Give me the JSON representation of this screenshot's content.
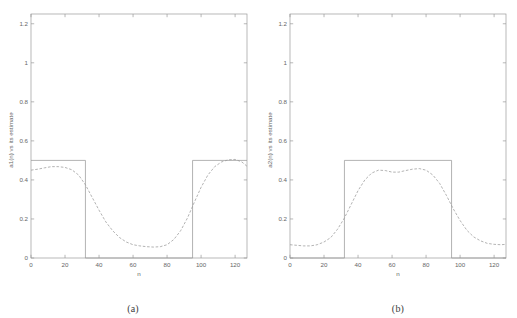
{
  "figure": {
    "background": "#ffffff",
    "line_color": "#9a9a9a",
    "text_color": "#666666",
    "panels": [
      {
        "id": "a",
        "caption": "(a)",
        "ylabel": "a1(n) vs its estimate",
        "xlabel": "n"
      },
      {
        "id": "b",
        "caption": "(b)",
        "ylabel": "a2(n) vs its estimate",
        "xlabel": "n"
      }
    ]
  },
  "chart_data": [
    {
      "type": "line",
      "title": "",
      "panel": "(a)",
      "xlabel": "n",
      "ylabel": "a1(n) vs its estimate",
      "xlim": [
        0,
        127
      ],
      "ylim": [
        0,
        1.25
      ],
      "xticks": [
        0,
        20,
        40,
        60,
        80,
        100,
        120
      ],
      "xticklabels": [
        "0",
        "20",
        "40",
        "60",
        "80",
        "100",
        "120"
      ],
      "yticks": [
        0,
        0.2,
        0.4,
        0.6,
        0.8,
        1,
        1.2
      ],
      "yticklabels": [
        "0",
        "0.2",
        "0.4",
        "0.6",
        "0.8",
        "1",
        "1.2"
      ],
      "grid": false,
      "legend": null,
      "series": [
        {
          "name": "a1(n) true (square wave)",
          "style": "solid",
          "color": "#9a9a9a",
          "x": [
            0,
            32,
            32,
            95,
            95,
            127
          ],
          "y": [
            0.5,
            0.5,
            0.0,
            0.0,
            0.5,
            0.5
          ]
        },
        {
          "name": "a1(n) estimate (dashed)",
          "style": "dashed",
          "color": "#9a9a9a",
          "x": [
            0,
            4,
            8,
            12,
            16,
            20,
            24,
            28,
            32,
            36,
            40,
            44,
            48,
            52,
            56,
            60,
            64,
            68,
            72,
            76,
            80,
            84,
            88,
            92,
            96,
            100,
            104,
            108,
            112,
            116,
            120,
            124,
            127
          ],
          "y": [
            0.45,
            0.455,
            0.462,
            0.468,
            0.468,
            0.464,
            0.452,
            0.425,
            0.375,
            0.31,
            0.245,
            0.185,
            0.14,
            0.105,
            0.082,
            0.068,
            0.062,
            0.058,
            0.056,
            0.058,
            0.068,
            0.095,
            0.14,
            0.205,
            0.285,
            0.362,
            0.425,
            0.468,
            0.492,
            0.503,
            0.505,
            0.492,
            0.47
          ]
        }
      ]
    },
    {
      "type": "line",
      "title": "",
      "panel": "(b)",
      "xlabel": "n",
      "ylabel": "a2(n) vs its estimate",
      "xlim": [
        0,
        127
      ],
      "ylim": [
        0,
        1.25
      ],
      "xticks": [
        0,
        20,
        40,
        60,
        80,
        100,
        120
      ],
      "xticklabels": [
        "0",
        "20",
        "40",
        "60",
        "80",
        "100",
        "120"
      ],
      "yticks": [
        0,
        0.2,
        0.4,
        0.6,
        0.8,
        1,
        1.2
      ],
      "yticklabels": [
        "0",
        "0.2",
        "0.4",
        "0.6",
        "0.8",
        "1",
        "1.2"
      ],
      "grid": false,
      "legend": null,
      "series": [
        {
          "name": "a2(n) true (square wave)",
          "style": "solid",
          "color": "#9a9a9a",
          "x": [
            0,
            32,
            32,
            95,
            95,
            127
          ],
          "y": [
            0.0,
            0.0,
            0.5,
            0.5,
            0.0,
            0.0
          ]
        },
        {
          "name": "a2(n) estimate (dashed)",
          "style": "dashed",
          "color": "#9a9a9a",
          "x": [
            0,
            4,
            8,
            12,
            16,
            20,
            24,
            28,
            32,
            36,
            40,
            44,
            48,
            52,
            56,
            60,
            64,
            68,
            72,
            76,
            80,
            84,
            88,
            92,
            96,
            100,
            104,
            108,
            112,
            116,
            120,
            124,
            127
          ],
          "y": [
            0.068,
            0.065,
            0.062,
            0.062,
            0.068,
            0.082,
            0.105,
            0.148,
            0.205,
            0.275,
            0.345,
            0.4,
            0.435,
            0.45,
            0.448,
            0.44,
            0.44,
            0.448,
            0.455,
            0.458,
            0.45,
            0.425,
            0.382,
            0.32,
            0.252,
            0.192,
            0.142,
            0.108,
            0.088,
            0.075,
            0.07,
            0.068,
            0.07
          ]
        }
      ]
    }
  ]
}
